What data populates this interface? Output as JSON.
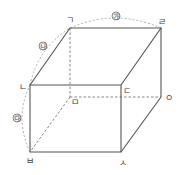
{
  "diagram": {
    "type": "cuboid",
    "colors": {
      "edge": "#555555",
      "hidden": "#777777",
      "arc": "#999999",
      "label": "#444444"
    },
    "vertices": {
      "giyeok": {
        "label": "ㄱ",
        "x": 70,
        "y": 28
      },
      "rieul": {
        "label": "ㄹ",
        "x": 161,
        "y": 28
      },
      "nieun": {
        "label": "ㄴ",
        "x": 30,
        "y": 85
      },
      "digeut": {
        "label": "ㄷ",
        "x": 121,
        "y": 85
      },
      "mieum": {
        "label": "ㅁ",
        "x": 70,
        "y": 97
      },
      "ieung": {
        "label": "ㅇ",
        "x": 161,
        "y": 97
      },
      "bieup": {
        "label": "ㅂ",
        "x": 30,
        "y": 152
      },
      "siot": {
        "label": "ㅅ",
        "x": 121,
        "y": 152
      }
    },
    "edge_labels": {
      "ga": "㉮",
      "na": "㉯",
      "da": "㉰"
    }
  }
}
